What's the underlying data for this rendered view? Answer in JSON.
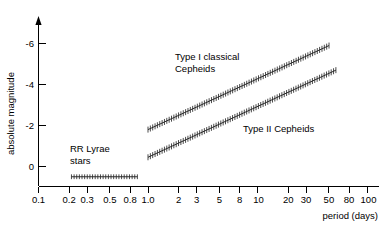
{
  "chart_data": {
    "type": "line",
    "title": "",
    "subtitle": "",
    "xlabel": "period (days)",
    "ylabel": "absolute magnitude",
    "xscale": "log",
    "xlim": [
      0.1,
      100
    ],
    "ylim": [
      1.0,
      -6.8
    ],
    "grid": false,
    "legend": "inline-annotations",
    "xticks": [
      {
        "value": 0.1,
        "label": "0.1"
      },
      {
        "value": 0.2,
        "label": "0.2"
      },
      {
        "value": 0.3,
        "label": "0.3"
      },
      {
        "value": 0.5,
        "label": "0.5"
      },
      {
        "value": 0.8,
        "label": "0.8"
      },
      {
        "value": 1.0,
        "label": "1.0"
      },
      {
        "value": 2,
        "label": "2"
      },
      {
        "value": 3,
        "label": "3"
      },
      {
        "value": 5,
        "label": "5"
      },
      {
        "value": 8,
        "label": "8"
      },
      {
        "value": 10,
        "label": "10"
      },
      {
        "value": 20,
        "label": "20"
      },
      {
        "value": 30,
        "label": "30"
      },
      {
        "value": 50,
        "label": "50"
      },
      {
        "value": 80,
        "label": "80"
      },
      {
        "value": 100,
        "label": "100"
      }
    ],
    "yticks": [
      {
        "value": -6,
        "label": "-6"
      },
      {
        "value": -4,
        "label": "-4"
      },
      {
        "value": -2,
        "label": "-2"
      },
      {
        "value": 0,
        "label": "0"
      }
    ],
    "series": [
      {
        "name": "Type I classical Cepheids",
        "style": "hatched-band",
        "x_start": 1.0,
        "x_end": 45,
        "y_start": -1.8,
        "y_end": -5.9,
        "label": "Type I classical",
        "label_line2": "Cepheids",
        "points": [
          {
            "period": 1.0,
            "magnitude": -1.8
          },
          {
            "period": 2.0,
            "magnitude": -2.55
          },
          {
            "period": 3.0,
            "magnitude": -2.98
          },
          {
            "period": 5.0,
            "magnitude": -3.53
          },
          {
            "period": 8.0,
            "magnitude": -4.05
          },
          {
            "period": 10.0,
            "magnitude": -4.25
          },
          {
            "period": 20.0,
            "magnitude": -4.98
          },
          {
            "period": 30.0,
            "magnitude": -5.41
          },
          {
            "period": 45.0,
            "magnitude": -5.9
          }
        ]
      },
      {
        "name": "Type II Cepheids",
        "style": "hatched-band",
        "x_start": 1.0,
        "x_end": 52,
        "y_start": -0.45,
        "y_end": -4.7,
        "label": "Type II Cepheids",
        "points": [
          {
            "period": 1.0,
            "magnitude": -0.45
          },
          {
            "period": 2.0,
            "magnitude": -1.22
          },
          {
            "period": 3.0,
            "magnitude": -1.67
          },
          {
            "period": 5.0,
            "magnitude": -2.23
          },
          {
            "period": 8.0,
            "magnitude": -2.76
          },
          {
            "period": 10.0,
            "magnitude": -2.97
          },
          {
            "period": 20.0,
            "magnitude": -3.73
          },
          {
            "period": 30.0,
            "magnitude": -4.17
          },
          {
            "period": 52.0,
            "magnitude": -4.7
          }
        ]
      },
      {
        "name": "RR Lyrae stars",
        "style": "hatched-band",
        "x_start": 0.2,
        "x_end": 0.8,
        "y_start": 0.5,
        "y_end": 0.5,
        "label": "RR Lyrae",
        "label_line2": "stars",
        "points": [
          {
            "period": 0.2,
            "magnitude": 0.5
          },
          {
            "period": 0.3,
            "magnitude": 0.5
          },
          {
            "period": 0.5,
            "magnitude": 0.5
          },
          {
            "period": 0.8,
            "magnitude": 0.5
          }
        ]
      }
    ]
  },
  "axes": {
    "x_title": "period (days)",
    "y_title": "absolute magnitude"
  },
  "annotations": {
    "type_i_line1": "Type I classical",
    "type_i_line2": "Cepheids",
    "type_ii": "Type II Cepheids",
    "rr_lyrae_line1": "RR Lyrae",
    "rr_lyrae_line2": "stars"
  },
  "colors": {
    "axis": "#000000",
    "band": "#2a2a2a",
    "background": "#ffffff"
  }
}
